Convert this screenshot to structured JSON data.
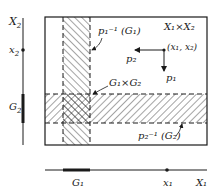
{
  "labels": {
    "x2_axis": "X",
    "x2_axis_sub": "2",
    "x2_point": "x",
    "x2_point_sub": "2",
    "g2": "G",
    "g2_sub": "2",
    "product": "X₁×X₂",
    "point": "(x₁, x₂)",
    "p1_arrow": "p₁",
    "p2_arrow": "p₂",
    "preimage_g1": "p₁⁻¹ (G₁)",
    "g1xg2": "G₁×G₂",
    "preimage_g2": "p₂⁻¹ (G₂)",
    "g1": "G₁",
    "x1_point": "x₁",
    "x1_axis": "X₁"
  },
  "colors": {
    "ink": "#1a1a1a",
    "background": "#ffffff"
  }
}
